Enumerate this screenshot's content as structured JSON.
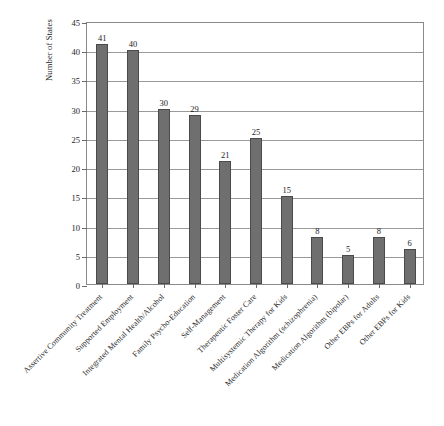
{
  "chart_data": {
    "type": "bar",
    "title": "",
    "xlabel": "",
    "ylabel": "Number of States",
    "ylim": [
      0,
      45
    ],
    "ytick_step": 5,
    "yticks": [
      "0",
      "5",
      "10",
      "15",
      "20",
      "25",
      "30",
      "35",
      "40",
      "45"
    ],
    "grid": true,
    "legend": null,
    "bar_color": "#6f6f6f",
    "bar_edge_color": "#4a4a4a",
    "categories": [
      "Assertive Community Treatment",
      "Supported Employment",
      "Integrated Mental Health/Alcohol",
      "Family Psycho-Education",
      "Self-Management",
      "Therapeutic Foster Care",
      "Multisystemic Therapy for Kids",
      "Medication Algorithm (schizophrenia)",
      "Medication Algorithm (bipolar)",
      "Other EBPs for Adults",
      "Other EBPs for Kids"
    ],
    "values": [
      41,
      40,
      30,
      29,
      21,
      25,
      15,
      8,
      5,
      8,
      6
    ],
    "value_labels": [
      "41",
      "40",
      "30",
      "29",
      "21",
      "25",
      "15",
      "8",
      "5",
      "8",
      "6"
    ]
  },
  "caption": ""
}
